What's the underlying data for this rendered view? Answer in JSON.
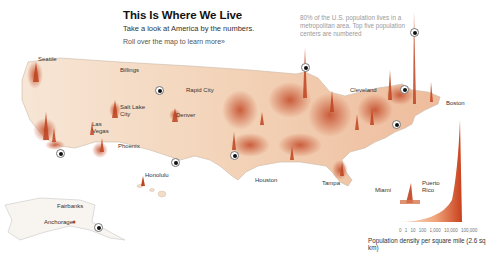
{
  "header": {
    "title": "This Is Where We Live",
    "subtitle": "Take a look at America by the numbers.",
    "rollover_link": "Roll over the map to learn more»"
  },
  "note": "80% of the U.S. population lives in a metropolitan area. Top five population centers are numbered",
  "cities": {
    "seattle": "Seattle",
    "billings": "Billings",
    "salt_lake_city_1": "Salt Lake",
    "salt_lake_city_2": "City",
    "rapid_city": "Rapid City",
    "denver": "Denver",
    "las_vegas_1": "Las",
    "las_vegas_2": "Vegas",
    "phoenix": "Phoenix",
    "honolulu": "Honolulu",
    "houston": "Houston",
    "tampa": "Tampa",
    "miami": "Miami",
    "cleveland": "Cleveland",
    "boston": "Boston",
    "puerto_rico_1": "Puerto",
    "puerto_rico_2": "Rico",
    "fairbanks": "Fairbanks",
    "anchorage": "Anchorage"
  },
  "legend": {
    "ticks": [
      "0",
      "1",
      "10",
      "100",
      "1,000",
      "10,000",
      "100,000"
    ],
    "ticks_text": "0 1 10 100 1,000 10,000 100,000",
    "label": "Population density per square mile (2.6 sq km)",
    "color_low": "#f6e3cf",
    "color_high": "#c8401c"
  },
  "markers": [
    {
      "name": "los-angeles-marker"
    },
    {
      "name": "chicago-marker"
    },
    {
      "name": "new-york-marker"
    },
    {
      "name": "philadelphia-marker"
    },
    {
      "name": "dallas-marker"
    }
  ]
}
